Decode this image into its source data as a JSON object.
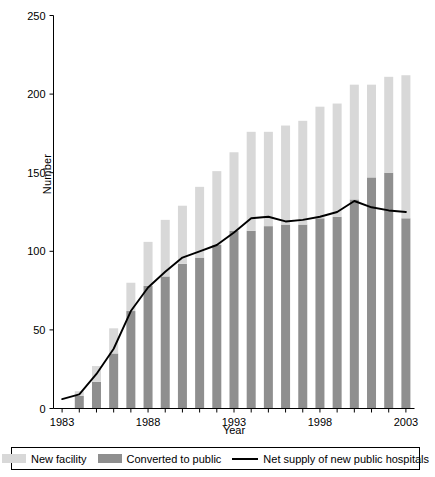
{
  "chart_data": {
    "type": "bar",
    "title": "",
    "xlabel": "Year",
    "ylabel": "Number",
    "ylim": [
      0,
      250
    ],
    "yticks": [
      0,
      50,
      100,
      150,
      200,
      250
    ],
    "xticks": [
      1983,
      1988,
      1993,
      1998,
      2003
    ],
    "grid": false,
    "legend_position": "bottom",
    "categories": [
      1983,
      1984,
      1985,
      1986,
      1987,
      1988,
      1989,
      1990,
      1991,
      1992,
      1993,
      1994,
      1995,
      1996,
      1997,
      1998,
      1999,
      2000,
      2001,
      2002,
      2003
    ],
    "series": [
      {
        "name": "Converted to public",
        "color": "#8f8f8f",
        "values": [
          0,
          8,
          17,
          35,
          62,
          78,
          84,
          92,
          96,
          104,
          113,
          113,
          116,
          117,
          117,
          121,
          122,
          133,
          147,
          150,
          121
        ]
      },
      {
        "name": "New facility",
        "color": "#d8d8d8",
        "values": [
          0,
          3,
          10,
          16,
          18,
          28,
          36,
          37,
          45,
          47,
          50,
          63,
          60,
          63,
          66,
          71,
          72,
          73,
          59,
          61,
          91
        ]
      },
      {
        "name": "Net supply of new public hospitals",
        "type": "line",
        "color": "#000000",
        "values": [
          6,
          9,
          22,
          38,
          62,
          77,
          87,
          96,
          100,
          104,
          112,
          121,
          122,
          119,
          120,
          122,
          125,
          132,
          128,
          126,
          125
        ]
      }
    ],
    "stacked_totals": [
      0,
      11,
      27,
      51,
      80,
      106,
      120,
      129,
      141,
      151,
      163,
      176,
      176,
      180,
      183,
      192,
      194,
      206,
      206,
      211,
      212
    ]
  },
  "legend": {
    "items": [
      {
        "label": "New facility",
        "icon": "swatch-light",
        "color": "#d8d8d8"
      },
      {
        "label": "Converted to public",
        "icon": "swatch-dark",
        "color": "#8f8f8f"
      },
      {
        "label": "Net supply of new public hospitals",
        "icon": "line-black",
        "color": "#000000"
      }
    ]
  }
}
